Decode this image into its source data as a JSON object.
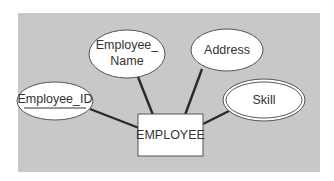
{
  "diagram": {
    "type": "entity-relationship",
    "background_color": "#ffffff",
    "panel_color": "#c8c8c8",
    "entity": {
      "label": "EMPLOYEE",
      "fill": "#ffffff"
    },
    "attributes": [
      {
        "id": "employee_id",
        "label": "Employee_ID",
        "kind": "key",
        "underlined": true
      },
      {
        "id": "employee_name",
        "label_line1": "Employee_",
        "label_line2": "Name",
        "kind": "simple"
      },
      {
        "id": "address",
        "label": "Address",
        "kind": "simple"
      },
      {
        "id": "skill",
        "label": "Skill",
        "kind": "multivalued",
        "double_border": true
      }
    ],
    "relationships": [
      {
        "from": "EMPLOYEE",
        "to": "Employee_ID"
      },
      {
        "from": "EMPLOYEE",
        "to": "Employee_Name"
      },
      {
        "from": "EMPLOYEE",
        "to": "Address"
      },
      {
        "from": "EMPLOYEE",
        "to": "Skill"
      }
    ]
  }
}
